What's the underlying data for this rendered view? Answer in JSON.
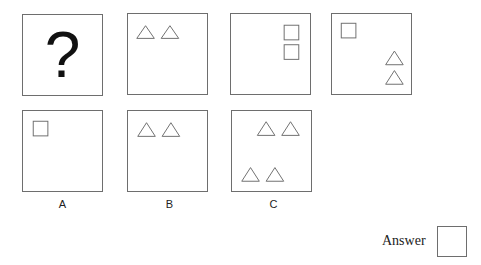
{
  "question_row": {
    "panels": [
      {
        "id": "q1",
        "content": "question-mark",
        "symbol": "?"
      },
      {
        "id": "q2",
        "content": "two triangles top-left, horizontal"
      },
      {
        "id": "q3",
        "content": "two squares top-right, vertical"
      },
      {
        "id": "q4",
        "content": "one square top-left, two triangles bottom-right vertical"
      }
    ]
  },
  "options": [
    {
      "label": "A",
      "content": "one square top-left"
    },
    {
      "label": "B",
      "content": "two triangles top-left, horizontal"
    },
    {
      "label": "C",
      "content": "two triangles top-right, two triangles bottom-left"
    }
  ],
  "answer": {
    "label": "Answer",
    "value": ""
  },
  "colors": {
    "stroke": "#6e6e6e",
    "text": "#222222"
  }
}
